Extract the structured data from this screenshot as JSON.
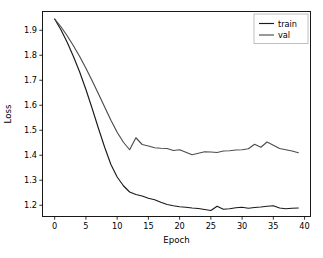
{
  "chart_data": {
    "type": "line",
    "title": "",
    "xlabel": "Epoch",
    "ylabel": "Loss",
    "xlim": [
      -1.95,
      40.95
    ],
    "ylim": [
      1.155,
      1.975
    ],
    "xticks": [
      0,
      5,
      10,
      15,
      20,
      25,
      30,
      35,
      40
    ],
    "xtick_labels": [
      "0",
      "5",
      "10",
      "15",
      "20",
      "25",
      "30",
      "35",
      "40"
    ],
    "yticks": [
      1.2,
      1.3,
      1.4,
      1.5,
      1.6,
      1.7,
      1.8,
      1.9
    ],
    "ytick_labels": [
      "1.2",
      "1.3",
      "1.4",
      "1.5",
      "1.6",
      "1.7",
      "1.8",
      "1.9"
    ],
    "grid": false,
    "legend_position": "upper right",
    "x": [
      0,
      1,
      2,
      3,
      4,
      5,
      6,
      7,
      8,
      9,
      10,
      11,
      12,
      13,
      14,
      15,
      16,
      17,
      18,
      19,
      20,
      21,
      22,
      23,
      24,
      25,
      26,
      27,
      28,
      29,
      30,
      31,
      32,
      33,
      34,
      35,
      36,
      37,
      38,
      39
    ],
    "series": [
      {
        "name": "train",
        "color": "#1a1a1a",
        "values": [
          1.945,
          1.902,
          1.852,
          1.795,
          1.733,
          1.663,
          1.587,
          1.508,
          1.432,
          1.363,
          1.313,
          1.278,
          1.253,
          1.243,
          1.237,
          1.228,
          1.222,
          1.212,
          1.203,
          1.198,
          1.194,
          1.192,
          1.189,
          1.187,
          1.183,
          1.179,
          1.196,
          1.184,
          1.186,
          1.19,
          1.192,
          1.188,
          1.191,
          1.193,
          1.196,
          1.198,
          1.189,
          1.186,
          1.188,
          1.189
        ]
      },
      {
        "name": "val",
        "color": "#4d4d4d",
        "values": [
          1.945,
          1.914,
          1.878,
          1.838,
          1.795,
          1.748,
          1.698,
          1.646,
          1.593,
          1.54,
          1.492,
          1.452,
          1.422,
          1.47,
          1.443,
          1.437,
          1.43,
          1.428,
          1.427,
          1.419,
          1.422,
          1.412,
          1.402,
          1.408,
          1.414,
          1.413,
          1.411,
          1.417,
          1.418,
          1.421,
          1.422,
          1.426,
          1.444,
          1.432,
          1.453,
          1.44,
          1.427,
          1.422,
          1.417,
          1.41
        ]
      }
    ],
    "legend": [
      {
        "label": "train",
        "color": "#1a1a1a"
      },
      {
        "label": "val",
        "color": "#4d4d4d"
      }
    ]
  },
  "figure": {
    "background": "#ffffff",
    "axes_color": "#000000"
  }
}
